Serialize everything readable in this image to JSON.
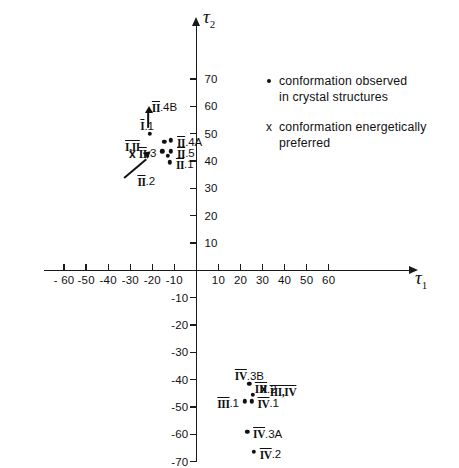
{
  "chart_data": {
    "type": "scatter",
    "title": "",
    "xlabel": "τ₁",
    "ylabel": "τ₂",
    "xlim": [
      -70,
      70
    ],
    "ylim": [
      -75,
      78
    ],
    "xticks": [
      -60,
      -50,
      -40,
      -30,
      -20,
      -10,
      10,
      20,
      30,
      40,
      50,
      60
    ],
    "yticks": [
      10,
      20,
      30,
      40,
      50,
      60,
      70,
      -10,
      -20,
      -30,
      -40,
      -50,
      -60,
      -70
    ],
    "xtick_labels": [
      "- 60",
      "-50",
      "-40",
      "-30",
      "-20",
      "-10",
      "10",
      "20",
      "30",
      "40",
      "50",
      "60"
    ],
    "ytick_labels": [
      "10",
      "20",
      "30",
      "40",
      "50",
      "60",
      "70",
      "-10",
      "-20",
      "-30",
      "-40",
      "-50",
      "-60",
      "-70"
    ],
    "grid": false,
    "legend_position": "upper right",
    "series": [
      {
        "name": "conformation observed in crystal structures",
        "marker": "dot",
        "points": [
          {
            "label": "I.1",
            "x": -21.0,
            "y": 50.0,
            "label_pos": "above-left"
          },
          {
            "label": "II.4A",
            "x": -11.5,
            "y": 47.5,
            "label_pos": "right"
          },
          {
            "label": "",
            "x": -14.5,
            "y": 47.0,
            "label_pos": "none"
          },
          {
            "label": "II.5",
            "x": -11.5,
            "y": 43.5,
            "label_pos": "right"
          },
          {
            "label": "II.3",
            "x": -15.5,
            "y": 43.5,
            "label_pos": "left"
          },
          {
            "label": "",
            "x": -13.0,
            "y": 42.0,
            "label_pos": "none"
          },
          {
            "label": "II.1",
            "x": -12.0,
            "y": 39.5,
            "label_pos": "right"
          },
          {
            "label": "III.1",
            "x": 22.0,
            "y": -48.0,
            "label_pos": "left"
          },
          {
            "label": "IV.1",
            "x": 25.0,
            "y": -48.0,
            "label_pos": "right"
          },
          {
            "label": "",
            "x": 25.5,
            "y": -45.5,
            "label_pos": "none"
          },
          {
            "label": "IV.3B",
            "x": 24.0,
            "y": -41.5,
            "label_pos": "above"
          },
          {
            "label": "IV.3A",
            "x": 23.0,
            "y": -59.0,
            "label_pos": "right"
          },
          {
            "label": "IV.2",
            "x": 26.0,
            "y": -66.5,
            "label_pos": "right"
          }
        ]
      },
      {
        "name": "conformation energetically preferred",
        "marker": "x",
        "points": [
          {
            "label": "I,II",
            "x": -29.0,
            "y": 42.5,
            "label_pos": "above"
          },
          {
            "label": "III,IV",
            "x": 30.5,
            "y": -43.5,
            "label_pos": "right"
          }
        ]
      }
    ],
    "annotations": [
      {
        "label": "II.4B",
        "x": -14.5,
        "y": 59.0,
        "arrow": "up",
        "note": "label with vertical arrow pointing toward cluster"
      },
      {
        "label": "II.2",
        "x": -19.5,
        "y": 32.5,
        "arrow": "up-right",
        "note": "label with diagonal arrow pointing toward cluster"
      },
      {
        "label": "III.2",
        "x": 26.5,
        "y": -44.0,
        "arrow": "none",
        "note": "label adjacent to the III,IV energetic minimum"
      }
    ]
  },
  "axes": {
    "x_title": "τ",
    "x_sub": "1",
    "y_title": "τ",
    "y_sub": "2"
  },
  "legend": {
    "items": [
      {
        "marker": "dot",
        "line1": "conformation  observed",
        "line2": "in  crystal  structures"
      },
      {
        "marker": "x",
        "line1": "conformation  energetically",
        "line2": "preferred"
      }
    ]
  },
  "labels": {
    "i1": "I.1",
    "ii4a": "II.4A",
    "ii5": "II.5",
    "ii3": "II.3",
    "ii1": "II.1",
    "ii4b": "II.4B",
    "ii2": "II.2",
    "i_ii": "I,II",
    "iii_iv": "III,IV",
    "iii1": "III.1",
    "iii2": "III.2",
    "iv1": "IV.1",
    "iv3a": "IV.3A",
    "iv3b": "IV.3B",
    "iv2": "IV.2",
    "xmark": "x"
  }
}
